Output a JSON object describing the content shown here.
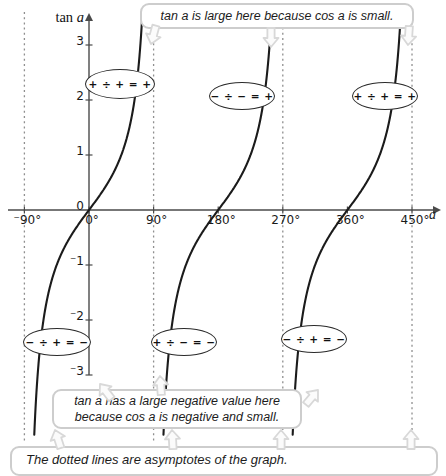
{
  "colors": {
    "background": "#ffffff",
    "curve": "#1b1b1b",
    "axis": "#4a4a4a",
    "asymptote": "#8f8f8f",
    "text": "#1a1a1a",
    "callout_border": "#cdcdcd",
    "callout_fill": "#ffffff",
    "arrow_border": "#d8d8d8",
    "arrow_fill": "#fbfbfb",
    "badge_border": "#2b2b2b",
    "badge_fill": "#ffffff"
  },
  "chart_layout": {
    "origin_px": {
      "x": 89,
      "y": 210
    },
    "px_per_degree": 0.7178,
    "px_per_unit": 55,
    "curve_top_px": 14,
    "curve_bottom_px": 435,
    "asymptote_top_px": 12,
    "asymptote_bottom_px": 442,
    "x_axis_start_px": 8,
    "x_axis_end_px": 440,
    "y_axis_top_px": 16,
    "y_axis_bottom_px": 375
  },
  "chart_data": {
    "type": "line",
    "function": "tan a",
    "title": "",
    "xlabel": "a",
    "ylabel": "tan a",
    "x_unit": "degrees",
    "x_ticks_deg": [
      -90,
      0,
      90,
      180,
      270,
      360,
      450
    ],
    "x_tick_labels": [
      "⁻90°",
      "0°",
      "90°",
      "180°",
      "270°",
      "360°",
      "450°"
    ],
    "y_ticks": [
      3,
      2,
      1,
      0,
      -1,
      -2,
      -3
    ],
    "y_tick_labels": [
      "3",
      "2",
      "1",
      "0",
      "⁻1",
      "⁻2",
      "⁻3"
    ],
    "xlim_deg": [
      -113,
      487
    ],
    "ylim": [
      -4.1,
      3.6
    ],
    "grid": false,
    "legend": "none",
    "branch_centers_deg": [
      0,
      180,
      360
    ],
    "asymptotes_deg": [
      -90,
      90,
      270,
      450
    ],
    "zeros_deg": [
      0,
      180,
      360
    ],
    "period_deg": 180,
    "sample_points": [
      {
        "a_deg": -45,
        "tan_a": -1
      },
      {
        "a_deg": 0,
        "tan_a": 0
      },
      {
        "a_deg": 45,
        "tan_a": 1
      },
      {
        "a_deg": 63,
        "tan_a": 2
      },
      {
        "a_deg": 72,
        "tan_a": 3
      },
      {
        "a_deg": 135,
        "tan_a": -1
      },
      {
        "a_deg": 180,
        "tan_a": 0
      },
      {
        "a_deg": 225,
        "tan_a": 1
      },
      {
        "a_deg": 315,
        "tan_a": -1
      },
      {
        "a_deg": 360,
        "tan_a": 0
      },
      {
        "a_deg": 405,
        "tan_a": 1
      }
    ]
  },
  "axis_titles": {
    "y_prefix": "tan",
    "y_var": "a",
    "x_var": "a"
  },
  "callouts": {
    "top": {
      "text": "tan a is large here because cos a is small.",
      "x": 140,
      "y": 3,
      "w": 274,
      "h": 26
    },
    "bottom": {
      "line1": "tan a has a large negative value here",
      "line2": "because cos a is negative and small.",
      "x": 52,
      "y": 389,
      "w": 250,
      "h": 40
    },
    "asymptote_note": {
      "text": "The dotted lines are asymptotes of the graph.",
      "x": 10,
      "y": 446,
      "w": 428,
      "h": 30
    }
  },
  "sign_badges": [
    {
      "text": "+ ÷ + = +",
      "x": 120,
      "y": 84,
      "w": 70,
      "h": 30
    },
    {
      "text": "− ÷ − = +",
      "x": 242,
      "y": 96,
      "w": 66,
      "h": 28
    },
    {
      "text": "+ ÷ + = +",
      "x": 385,
      "y": 96,
      "w": 66,
      "h": 28
    },
    {
      "text": "− ÷ + = −",
      "x": 57,
      "y": 342,
      "w": 68,
      "h": 28
    },
    {
      "text": "+ ÷ − = −",
      "x": 184,
      "y": 342,
      "w": 66,
      "h": 28
    },
    {
      "text": "− ÷ + = −",
      "x": 314,
      "y": 339,
      "w": 66,
      "h": 28
    }
  ],
  "arrows": [
    {
      "x": 151,
      "y": 44,
      "rot": 195
    },
    {
      "x": 271,
      "y": 47,
      "rot": 180
    },
    {
      "x": 408,
      "y": 45,
      "rot": 184
    },
    {
      "x": 100,
      "y": 384,
      "rot": -38
    },
    {
      "x": 160,
      "y": 376,
      "rot": -4
    },
    {
      "x": 318,
      "y": 390,
      "rot": 40
    },
    {
      "x": 55,
      "y": 430,
      "rot": -18
    },
    {
      "x": 172,
      "y": 430,
      "rot": -3
    },
    {
      "x": 281,
      "y": 430,
      "rot": 0
    },
    {
      "x": 411,
      "y": 430,
      "rot": 0
    }
  ]
}
